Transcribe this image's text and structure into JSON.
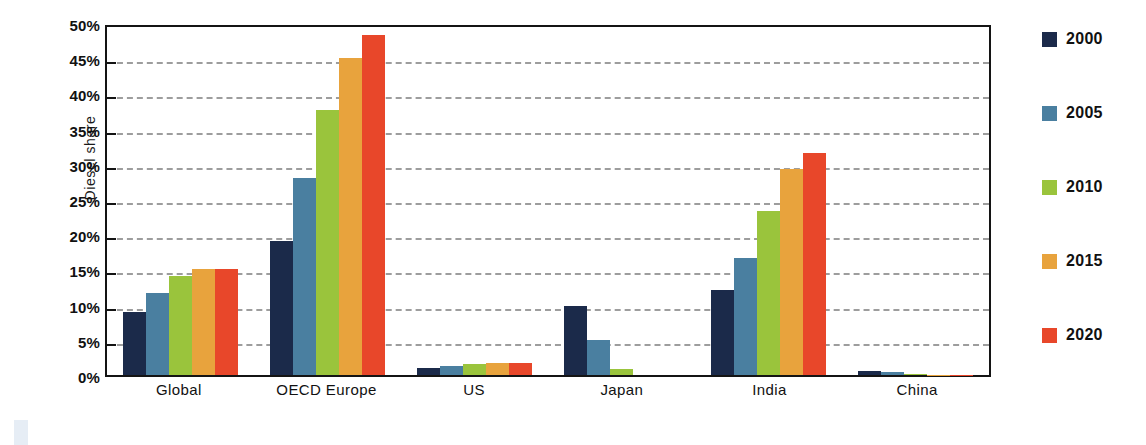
{
  "chart_data": {
    "type": "bar",
    "title": "",
    "xlabel": "",
    "ylabel": "Diesel share",
    "ylim": [
      0,
      50
    ],
    "y_tick_labels": [
      "50%",
      "45%",
      "40%",
      "35%",
      "30%",
      "25%",
      "20%",
      "15%",
      "10%",
      "5%",
      "0%"
    ],
    "y_ticks": [
      50,
      45,
      40,
      35,
      30,
      25,
      20,
      15,
      10,
      5,
      0
    ],
    "y_unit": "%",
    "grid": true,
    "grid_style": "dashed-horizontal",
    "legend_position": "right",
    "categories": [
      "Global",
      "OECD Europe",
      "US",
      "Japan",
      "India",
      "China"
    ],
    "series": [
      {
        "name": "2000",
        "color": "#1b2a4a",
        "values": [
          9.0,
          19.0,
          1.0,
          9.8,
          12.1,
          0.5
        ]
      },
      {
        "name": "2005",
        "color": "#4a7fa0",
        "values": [
          11.7,
          28.0,
          1.3,
          5.0,
          16.6,
          0.4
        ]
      },
      {
        "name": "2010",
        "color": "#9ac43c",
        "values": [
          14.0,
          37.7,
          1.6,
          0.9,
          23.3,
          0.1
        ]
      },
      {
        "name": "2015",
        "color": "#e8a33d",
        "values": [
          15.1,
          45.0,
          1.7,
          0.0,
          29.2,
          0.05
        ]
      },
      {
        "name": "2020",
        "color": "#e8472a",
        "values": [
          15.1,
          48.3,
          1.7,
          0.0,
          31.5,
          0.05
        ]
      }
    ]
  },
  "legend": {
    "items": [
      {
        "label": "2000",
        "color": "#1b2a4a"
      },
      {
        "label": "2005",
        "color": "#4a7fa0"
      },
      {
        "label": "2010",
        "color": "#9ac43c"
      },
      {
        "label": "2015",
        "color": "#e8a33d"
      },
      {
        "label": "2020",
        "color": "#e8472a"
      }
    ]
  },
  "axis": {
    "y_title": "Diesel share"
  },
  "colors": {
    "plot_border": "#141414",
    "gridline": "#9d9d9d",
    "background": "#ffffff",
    "text": "#111111"
  }
}
